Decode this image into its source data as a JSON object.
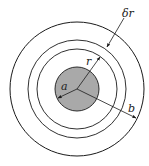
{
  "diagram": {
    "center": [
      77,
      89
    ],
    "colors": {
      "stroke": "#1a1a1a",
      "inner_fill": "#a9a9a9",
      "background": "#ffffff"
    },
    "circles": [
      {
        "name": "inner-conductor",
        "radius": 22,
        "filled": true
      },
      {
        "name": "shell-inner",
        "radius": 40,
        "filled": false
      },
      {
        "name": "shell-outer",
        "radius": 49,
        "filled": false
      },
      {
        "name": "outer-boundary",
        "radius": 67,
        "filled": false
      }
    ],
    "labels": {
      "a": "a",
      "r": "r",
      "b": "b",
      "dr": "δr"
    }
  }
}
